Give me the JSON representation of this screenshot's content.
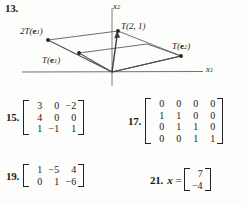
{
  "page": {
    "background": "#fdfdfb",
    "ink": "#1a1a1a"
  },
  "problems": [
    {
      "number": "13.",
      "type": "figure",
      "figure": {
        "axes": {
          "x_axis_label": "x",
          "x_axis_sub": "1",
          "y_axis_label": "x",
          "y_axis_sub": "2"
        },
        "points": [
          {
            "key": "two_T_e1",
            "label_main": "2T(",
            "label_bf": "e",
            "label_sub": "1",
            "label_end": ")",
            "x": 48,
            "y": 40
          },
          {
            "key": "T_e1",
            "label_main": "T(",
            "label_bf": "e",
            "label_sub": "1",
            "label_end": ")",
            "x": 79,
            "y": 53
          },
          {
            "key": "T_2_1",
            "label_main": "T(2, 1)",
            "label_bf": "",
            "label_sub": "",
            "label_end": "",
            "x": 118,
            "y": 31
          },
          {
            "key": "T_e2",
            "label_main": "T(",
            "label_bf": "e",
            "label_sub": "2",
            "label_end": ")",
            "x": 181,
            "y": 56
          }
        ],
        "origin": {
          "x": 112,
          "y": 72
        },
        "vector_arrow": {
          "from": "origin",
          "to": "T_2_1"
        }
      }
    },
    {
      "number": "15.",
      "type": "matrix",
      "rows": [
        [
          "3",
          "0",
          "−2"
        ],
        [
          "4",
          "0",
          "0"
        ],
        [
          "1",
          "−1",
          "1"
        ]
      ]
    },
    {
      "number": "17.",
      "type": "matrix",
      "rows": [
        [
          "0",
          "0",
          "0",
          "0"
        ],
        [
          "1",
          "1",
          "0",
          "0"
        ],
        [
          "0",
          "1",
          "1",
          "0"
        ],
        [
          "0",
          "0",
          "1",
          "1"
        ]
      ]
    },
    {
      "number": "19.",
      "type": "matrix",
      "rows": [
        [
          "1",
          "−5",
          "4"
        ],
        [
          "0",
          "1",
          "−6"
        ]
      ]
    },
    {
      "number": "21.",
      "type": "matrix",
      "prefix_var": "x",
      "prefix_eq": " =",
      "rows": [
        [
          "7"
        ],
        [
          "−4"
        ]
      ]
    }
  ]
}
